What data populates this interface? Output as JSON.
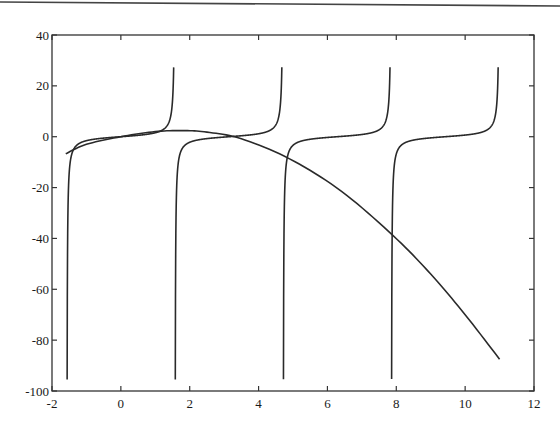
{
  "chart_data": {
    "type": "line",
    "title": "",
    "xlabel": "",
    "ylabel": "",
    "xlim": [
      -2,
      12
    ],
    "ylim": [
      -100,
      40
    ],
    "grid": false,
    "legend": null,
    "x_ticks": [
      -2,
      0,
      2,
      4,
      6,
      8,
      10,
      12
    ],
    "x_tick_labels": [
      "-2",
      "0",
      "2",
      "4",
      "6",
      "8",
      "10",
      "12"
    ],
    "y_ticks": [
      40,
      20,
      0,
      -20,
      -40,
      -60,
      -80,
      -100
    ],
    "y_tick_labels": [
      "40",
      "20",
      "0",
      "-20",
      "-40",
      "-60",
      "-80",
      "-100"
    ],
    "series": [
      {
        "name": "tan(x) branch 1",
        "kind": "tan",
        "x_range": [
          -1.5708,
          1.5708
        ],
        "clip": [
          -100,
          30
        ],
        "points": [
          [
            -1.56,
            -100
          ],
          [
            -1.5,
            -14.1
          ],
          [
            -1.4,
            -5.8
          ],
          [
            -1.0,
            -1.56
          ],
          [
            0,
            0
          ],
          [
            1.0,
            1.56
          ],
          [
            1.4,
            5.8
          ],
          [
            1.5,
            14.1
          ],
          [
            1.537,
            30
          ]
        ]
      },
      {
        "name": "tan(x) branch 2",
        "kind": "tan",
        "x_range": [
          1.5708,
          4.7124
        ],
        "clip": [
          -100,
          30
        ],
        "points": [
          [
            1.58,
            -100
          ],
          [
            1.65,
            -12.6
          ],
          [
            2.0,
            -2.19
          ],
          [
            3.1416,
            0
          ],
          [
            4.2,
            1.78
          ],
          [
            4.6,
            8.86
          ],
          [
            4.679,
            30
          ]
        ]
      },
      {
        "name": "tan(x) branch 3",
        "kind": "tan",
        "x_range": [
          4.7124,
          7.854
        ],
        "clip": [
          -100,
          30
        ],
        "points": [
          [
            4.722,
            -100
          ],
          [
            4.8,
            -11.4
          ],
          [
            5.2,
            -1.89
          ],
          [
            6.2832,
            0
          ],
          [
            7.4,
            2.04
          ],
          [
            7.75,
            9.6
          ],
          [
            7.821,
            30
          ]
        ]
      },
      {
        "name": "tan(x) branch 4",
        "kind": "tan",
        "x_range": [
          7.854,
          10.9956
        ],
        "clip": [
          -100,
          30
        ],
        "points": [
          [
            7.864,
            -100
          ],
          [
            7.95,
            -10.4
          ],
          [
            8.3,
            -2.1
          ],
          [
            9.4248,
            0
          ],
          [
            10.5,
            1.8
          ],
          [
            10.9,
            10.5
          ],
          [
            10.962,
            30
          ]
        ]
      },
      {
        "name": "smooth decreasing curve",
        "kind": "sampled",
        "points": [
          [
            -1.6,
            -6.7
          ],
          [
            -1.0,
            -3.0
          ],
          [
            0,
            0
          ],
          [
            1.0,
            2.0
          ],
          [
            1.8,
            2.4
          ],
          [
            2.5,
            1.8
          ],
          [
            3.5,
            -0.8
          ],
          [
            4.9,
            -8.7
          ],
          [
            6.4,
            -21.4
          ],
          [
            7.9,
            -38.8
          ],
          [
            9.0,
            -54
          ],
          [
            10.0,
            -70
          ],
          [
            11.0,
            -87.5
          ]
        ]
      }
    ]
  },
  "axes": {
    "x_tick_labels": [
      "-2",
      "0",
      "2",
      "4",
      "6",
      "8",
      "10",
      "12"
    ],
    "y_tick_labels": [
      "40",
      "20",
      "0",
      "-20",
      "-40",
      "-60",
      "-80",
      "-100"
    ]
  },
  "colors": {
    "line": "#2a2a2a",
    "axis": "#333333",
    "background": "#ffffff"
  }
}
